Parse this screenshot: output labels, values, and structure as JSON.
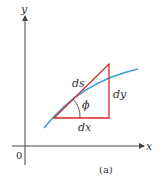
{
  "diagram": {
    "caption": "(a)",
    "axes": {
      "x_label": "x",
      "y_label": "y",
      "origin_label": "0"
    },
    "triangle": {
      "hypotenuse_label": "ds",
      "horizontal_label": "dx",
      "vertical_label": "dy",
      "angle_label": "ϕ"
    },
    "colors": {
      "curve": "#3aa0d8",
      "triangle": "#d42a2a",
      "axes": "#444444"
    }
  }
}
